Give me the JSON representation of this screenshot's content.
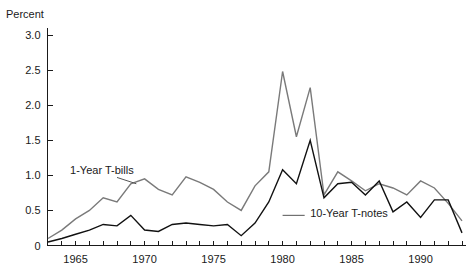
{
  "chart_data": {
    "type": "line",
    "title": "",
    "subtitle": "",
    "xlabel": "",
    "ylabel": "Percent",
    "xlim": [
      1963,
      1993
    ],
    "ylim": [
      0,
      3.2
    ],
    "grid": false,
    "legend_position": "inline-annotations",
    "x": [
      1963,
      1964,
      1965,
      1966,
      1967,
      1968,
      1969,
      1970,
      1971,
      1972,
      1973,
      1974,
      1975,
      1976,
      1977,
      1978,
      1979,
      1980,
      1981,
      1982,
      1983,
      1984,
      1985,
      1986,
      1987,
      1988,
      1989,
      1990,
      1991,
      1992,
      1993
    ],
    "x_tick_labels": [
      "1965",
      "1970",
      "1975",
      "1980",
      "1985",
      "1990"
    ],
    "x_tick_values": [
      1965,
      1970,
      1975,
      1980,
      1985,
      1990
    ],
    "y_tick_labels": [
      "0",
      "0.5",
      "1.0",
      "1.5",
      "2.0",
      "2.5",
      "3.0"
    ],
    "y_tick_values": [
      0,
      0.5,
      1.0,
      1.5,
      2.0,
      2.5,
      3.0
    ],
    "series": [
      {
        "name": "1-Year T-bills",
        "color": "#7a7a7a",
        "values": [
          0.1,
          0.22,
          0.38,
          0.5,
          0.68,
          0.62,
          0.88,
          0.95,
          0.8,
          0.72,
          0.98,
          0.9,
          0.8,
          0.62,
          0.5,
          0.85,
          1.05,
          2.48,
          1.55,
          2.25,
          0.72,
          1.05,
          0.92,
          0.78,
          0.88,
          0.82,
          0.72,
          0.92,
          0.82,
          0.6,
          0.35
        ]
      },
      {
        "name": "10-Year T-notes",
        "color": "#111111",
        "values": [
          0.05,
          0.1,
          0.16,
          0.22,
          0.3,
          0.28,
          0.43,
          0.22,
          0.2,
          0.3,
          0.32,
          0.3,
          0.28,
          0.3,
          0.14,
          0.32,
          0.62,
          1.08,
          0.88,
          1.5,
          0.68,
          0.88,
          0.9,
          0.72,
          0.92,
          0.48,
          0.62,
          0.4,
          0.65,
          0.65,
          0.18
        ]
      }
    ],
    "annotations": [
      {
        "text": "1-Year T-bills",
        "x": 1964.6,
        "y": 1.02,
        "leader_from": [
          1968.0,
          0.97
        ],
        "leader_to": [
          1969.4,
          0.88
        ]
      },
      {
        "text": "10-Year T-notes",
        "x": 1982.0,
        "y": 0.4,
        "leader_from": [
          1980.0,
          0.43
        ],
        "leader_to": [
          1981.6,
          0.43
        ]
      }
    ]
  }
}
